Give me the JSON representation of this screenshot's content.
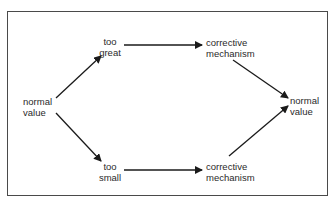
{
  "diagram": {
    "type": "flow",
    "nodes": {
      "start": {
        "line1": "normal",
        "line2": "value"
      },
      "too_great": {
        "line1": "too",
        "line2": "great"
      },
      "too_small": {
        "line1": "too",
        "line2": "small"
      },
      "corrective_top": {
        "line1": "corrective",
        "line2": "mechanism"
      },
      "corrective_bottom": {
        "line1": "corrective",
        "line2": "mechanism"
      },
      "end": {
        "line1": "normal",
        "line2": "value"
      }
    },
    "edges": [
      {
        "from": "start",
        "to": "too_great"
      },
      {
        "from": "start",
        "to": "too_small"
      },
      {
        "from": "too_great",
        "to": "corrective_top"
      },
      {
        "from": "too_small",
        "to": "corrective_bottom"
      },
      {
        "from": "corrective_top",
        "to": "end"
      },
      {
        "from": "corrective_bottom",
        "to": "end"
      }
    ]
  }
}
